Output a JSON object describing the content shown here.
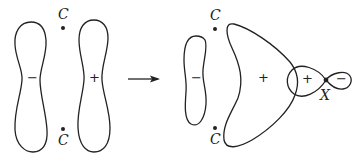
{
  "diagram": {
    "left_panel": {
      "atom_labels": [
        "C",
        "C"
      ],
      "lobe_left_sign": "−",
      "lobe_right_sign": "+"
    },
    "arrow": "right-arrow",
    "right_panel": {
      "atom_labels": [
        "C",
        "C"
      ],
      "lobe_left_sign": "−",
      "lobe_right_sign": "+",
      "x_orbital": {
        "lobe_big_sign": "+",
        "lobe_small_sign": "−",
        "atom_label": "X"
      }
    }
  }
}
